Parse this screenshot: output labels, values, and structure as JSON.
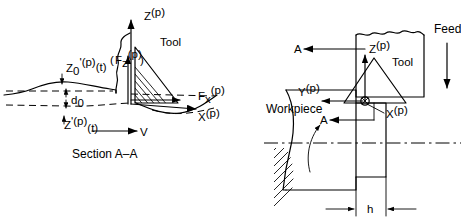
{
  "figure": {
    "caption_left": "Section A–A",
    "left_view": {
      "name": "orthogonal-cutting-section-view",
      "tool_label": "Tool",
      "velocity_label": "V",
      "depth_label": "d",
      "depth_sub": "0",
      "axes": [
        {
          "base": "Z",
          "sup": "(p)",
          "name": "z-axis-label"
        },
        {
          "base": "X",
          "sup": "(p)",
          "name": "x-axis-label"
        }
      ],
      "forces": [
        {
          "base": "F",
          "sub": "z",
          "sup": "(p)",
          "name": "force-z-label"
        },
        {
          "base": "F",
          "sub": "x",
          "sup": "(p)",
          "name": "force-x-label"
        }
      ],
      "surface_labels": [
        {
          "base": "Z",
          "sub": "0",
          "prime": "'",
          "sup": "(p)",
          "arg": "(t)",
          "name": "previous-surface-label"
        },
        {
          "base": "Z",
          "prime": "'",
          "sup": "(p)",
          "arg": "(t)",
          "name": "current-surface-label"
        }
      ]
    },
    "right_view": {
      "name": "turning-setup-plan-view",
      "tool_label": "Tool",
      "workpiece_label": "Workpiece",
      "feed_label": "Feed",
      "section_marks": [
        "A",
        "A"
      ],
      "width_label": "h",
      "axes": [
        {
          "base": "Z",
          "sup": "(p)",
          "name": "z-axis-label"
        },
        {
          "base": "Y",
          "sup": "(p)",
          "name": "y-axis-label"
        },
        {
          "base": "X",
          "sup": "(p)",
          "name": "x-axis-label"
        }
      ]
    },
    "colors": {
      "ink": "#000000",
      "background": "#ffffff"
    }
  }
}
